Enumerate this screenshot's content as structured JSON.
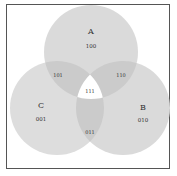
{
  "diagram": {
    "type": "venn",
    "sets": [
      {
        "name": "A",
        "code": "100"
      },
      {
        "name": "B",
        "code": "010"
      },
      {
        "name": "C",
        "code": "001"
      }
    ],
    "regions": {
      "ab": "110",
      "ac": "101",
      "bc": "011",
      "abc": "111"
    },
    "colors": {
      "circle_fill": "#d9d9d9",
      "overlap_fill": "#c8c8c8",
      "center_fill": "#ffffff",
      "frame": "#555555"
    }
  }
}
